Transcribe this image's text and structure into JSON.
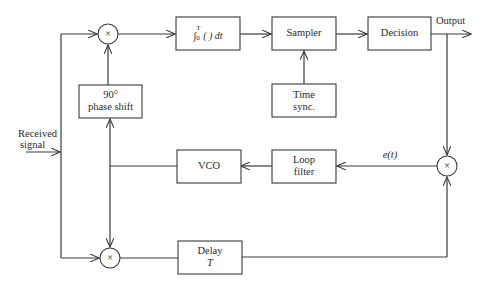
{
  "diagram": {
    "type": "block-diagram",
    "input_label": [
      "Received",
      "signal"
    ],
    "output_label": "Output",
    "blocks": {
      "mixer_top": "×",
      "mixer_bottom": "×",
      "mixer_right": "×",
      "integrator": "∫₀ᵀ( ) dt",
      "integrator_int": "∫",
      "integrator_sup": "T",
      "integrator_sub": "0",
      "integrator_rest": "( ) dt",
      "sampler": "Sampler",
      "decision": "Decision",
      "time_sync_line1": "Time",
      "time_sync_line2": "sync.",
      "phase_shift_line1": "90°",
      "phase_shift_line2": "phase shift",
      "vco": "VCO",
      "loop_filter_line1": "Loop",
      "loop_filter_line2": "filter",
      "delay_line1": "Delay",
      "delay_line2": "T"
    },
    "signal_labels": {
      "error": "e(t)"
    }
  }
}
